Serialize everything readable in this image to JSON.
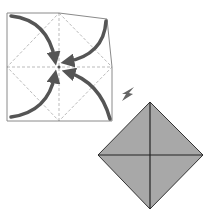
{
  "diagram": {
    "type": "origami-fold-step",
    "colors": {
      "background": "#ffffff",
      "paper_outline": "#8a8a8a",
      "crease_dashed": "#b8b8b8",
      "arrow": "#555555",
      "result_fill": "#a8a8a8",
      "result_lines": "#2a2a2a"
    },
    "steps": [
      {
        "name": "unfolded-square-with-creases",
        "arrows": 4,
        "target": "center"
      },
      {
        "name": "result-diamond",
        "folds": "corners folded to center"
      }
    ]
  }
}
